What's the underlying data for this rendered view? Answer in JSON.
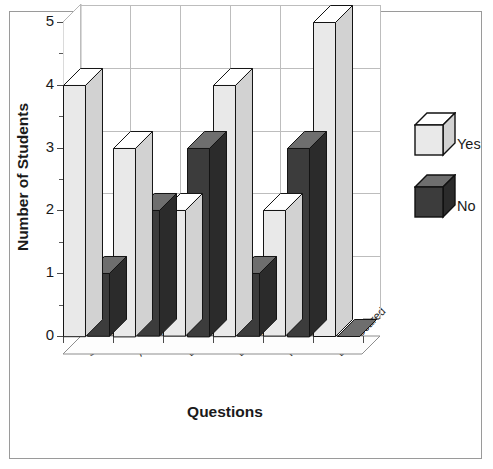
{
  "chart_data": {
    "type": "bar",
    "title": "",
    "subtitle": "",
    "xlabel": "Questions",
    "ylabel": "Number of Students",
    "categories": [
      "Scared?",
      "Ask More Than One?",
      "Be Friends?",
      "Enjoy?",
      "Interesting?",
      "Less Scared"
    ],
    "series": [
      {
        "name": "Yes",
        "values": [
          4,
          3,
          2,
          4,
          2,
          5
        ],
        "color": "#e9e9e9"
      },
      {
        "name": "No",
        "values": [
          1,
          2,
          3,
          1,
          3,
          0
        ],
        "color": "#3c3c3c"
      }
    ],
    "ylim": [
      0,
      5
    ],
    "yticks": [
      "0",
      "1",
      "2",
      "3",
      "4",
      "5"
    ],
    "grid": "horizontal-and-vertical",
    "legend_position": "right",
    "style": "3d-column",
    "annotations": []
  },
  "axes": {
    "y_title": "Number of Students",
    "x_title": "Questions",
    "y_tick_labels": [
      "0",
      "1",
      "2",
      "3",
      "4",
      "5"
    ],
    "x_tick_labels": [
      "Scared?",
      "Ask More Than One?",
      "Be Friends?",
      "Enjoy?",
      "Interesting?",
      "Less Scared"
    ]
  },
  "legend": {
    "items": [
      {
        "label": "Yes",
        "swatch": "light-gray-cube-swatch"
      },
      {
        "label": "No",
        "swatch": "dark-gray-cube-swatch"
      }
    ]
  },
  "colors": {
    "yes_front": "#e9e9e9",
    "yes_side": "#d2d2d2",
    "yes_top": "#ffffff",
    "no_front": "#3c3c3c",
    "no_side": "#2b2b2b",
    "no_top": "#6e6e6e",
    "grid": "#bdbdbd",
    "axis": "#4a4a4a",
    "frame": "#9a9a9a",
    "text": "#1a1a1a",
    "background": "#ffffff"
  }
}
